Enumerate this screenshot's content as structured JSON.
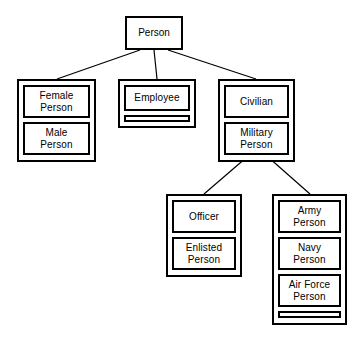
{
  "diagram": {
    "type": "class-taxonomy-hierarchy",
    "background_color": "#ffffff",
    "line_color": "#000000",
    "root": {
      "id": "person",
      "label": "Person"
    },
    "groups": [
      {
        "id": "gender-partition",
        "parent": "person",
        "has_empty_strip": false,
        "classes": [
          {
            "id": "female-person",
            "label": "Female\nPerson"
          },
          {
            "id": "male-person",
            "label": "Male\nPerson"
          }
        ]
      },
      {
        "id": "employment-partition",
        "parent": "person",
        "has_empty_strip": true,
        "classes": [
          {
            "id": "employee",
            "label": "Employee"
          }
        ]
      },
      {
        "id": "service-status-partition",
        "parent": "person",
        "has_empty_strip": false,
        "classes": [
          {
            "id": "civilian",
            "label": "Civilian"
          },
          {
            "id": "military-person",
            "label": "Military\nPerson"
          }
        ]
      },
      {
        "id": "rank-partition",
        "parent": "military-person",
        "has_empty_strip": false,
        "classes": [
          {
            "id": "officer",
            "label": "Officer"
          },
          {
            "id": "enlisted-person",
            "label": "Enlisted\nPerson"
          }
        ]
      },
      {
        "id": "branch-partition",
        "parent": "military-person",
        "has_empty_strip": true,
        "classes": [
          {
            "id": "army-person",
            "label": "Army\nPerson"
          },
          {
            "id": "navy-person",
            "label": "Navy\nPerson"
          },
          {
            "id": "air-force-person",
            "label": "Air Force\nPerson"
          }
        ]
      }
    ],
    "connectors": [
      {
        "id": "person-to-gender",
        "from": "person",
        "to": "gender-partition"
      },
      {
        "id": "person-to-employment",
        "from": "person",
        "to": "employment-partition"
      },
      {
        "id": "person-to-service-status",
        "from": "person",
        "to": "service-status-partition"
      },
      {
        "id": "military-to-rank",
        "from": "military-person",
        "to": "rank-partition"
      },
      {
        "id": "military-to-branch",
        "from": "military-person",
        "to": "branch-partition"
      }
    ]
  }
}
